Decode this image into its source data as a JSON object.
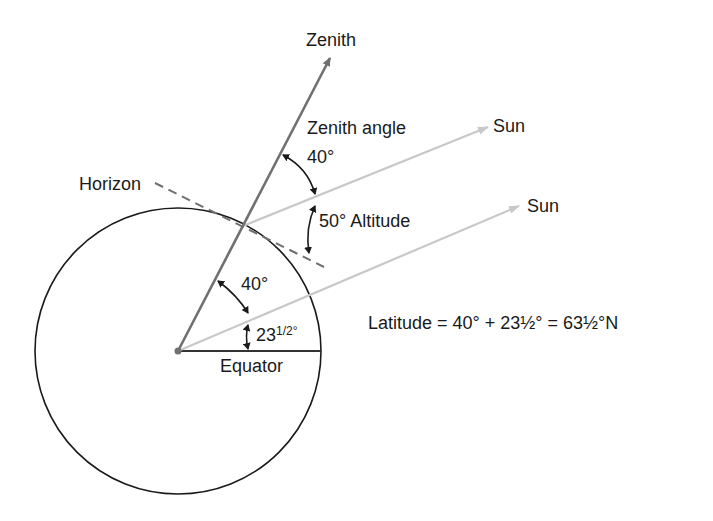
{
  "diagram": {
    "labels": {
      "zenith": "Zenith",
      "zenith_angle": "Zenith angle",
      "zenith_angle_value": "40°",
      "sun_upper": "Sun",
      "sun_lower": "Sun",
      "horizon": "Horizon",
      "altitude": "50° Altitude",
      "center_angle": "40°",
      "declination_main": "23",
      "declination_frac": "1/2°",
      "equator": "Equator",
      "latitude_formula": "Latitude = 40° + 23½° = 63½°N"
    },
    "colors": {
      "outline": "#1a1a1a",
      "zenith_line": "#707070",
      "sun_ray": "#c8c8c8",
      "horizon_dash": "#707070"
    }
  }
}
